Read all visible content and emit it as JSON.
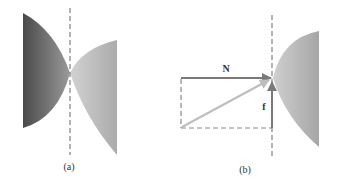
{
  "figure": {
    "panels": [
      {
        "id": "a",
        "caption": "(a)",
        "description": "Two curved surfaces touching at a single point on a vertical dashed line"
      },
      {
        "id": "b",
        "caption": "(b)",
        "description": "Force decomposition at contact point",
        "vectors": [
          {
            "name": "normal-force",
            "label": "N",
            "direction": "horizontal-right"
          },
          {
            "name": "friction-force",
            "label": "f",
            "direction": "vertical-up"
          },
          {
            "name": "resultant-force",
            "label": "",
            "direction": "diagonal"
          }
        ]
      }
    ]
  },
  "colors": {
    "dark_surface": "#555555",
    "light_surface": "#b8b8b8",
    "vector": "#7a7a7a",
    "resultant": "#bdbdbd",
    "dashed": "#8a8a8a"
  }
}
